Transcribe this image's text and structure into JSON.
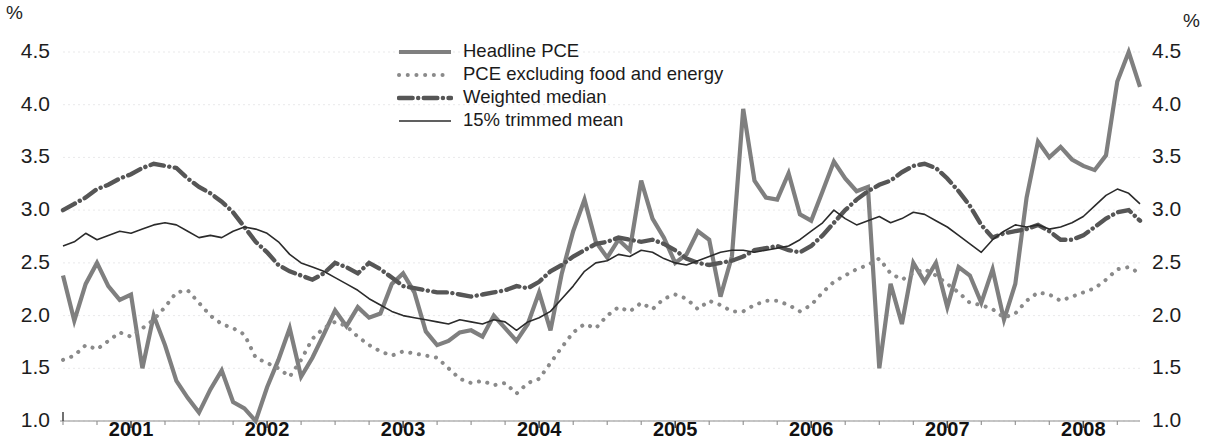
{
  "axis": {
    "unit_left": "%",
    "unit_right": "%",
    "y_ticks": [
      "1.0",
      "1.5",
      "2.0",
      "2.5",
      "3.0",
      "3.5",
      "4.0",
      "4.5"
    ],
    "x_ticks": [
      "2001",
      "2002",
      "2003",
      "2004",
      "2005",
      "2006",
      "2007",
      "2008"
    ]
  },
  "legend": {
    "items": [
      {
        "label": "Headline PCE",
        "style": "solid-thick",
        "color": "#7f7f7f"
      },
      {
        "label": "PCE excluding food and energy",
        "style": "dotted",
        "color": "#8a8a8a"
      },
      {
        "label": "Weighted median",
        "style": "dash-dot-thick",
        "color": "#565656"
      },
      {
        "label": "15% trimmed mean",
        "style": "solid-thin",
        "color": "#2b2b2b"
      }
    ]
  },
  "chart_data": {
    "type": "line",
    "title": "",
    "xlabel": "",
    "ylabel": "%",
    "ylim": [
      1.0,
      4.5
    ],
    "xlim": [
      "2000-07",
      "2008-07"
    ],
    "grid": true,
    "legend_position": "top-center",
    "x_tick_labels": [
      "2001",
      "2002",
      "2003",
      "2004",
      "2005",
      "2006",
      "2007",
      "2008"
    ],
    "y_tick_labels": [
      "1.0",
      "1.5",
      "2.0",
      "2.5",
      "3.0",
      "3.5",
      "4.0",
      "4.5"
    ],
    "x": [
      "2000-07",
      "2000-08",
      "2000-09",
      "2000-10",
      "2000-11",
      "2000-12",
      "2001-01",
      "2001-02",
      "2001-03",
      "2001-04",
      "2001-05",
      "2001-06",
      "2001-07",
      "2001-08",
      "2001-09",
      "2001-10",
      "2001-11",
      "2001-12",
      "2002-01",
      "2002-02",
      "2002-03",
      "2002-04",
      "2002-05",
      "2002-06",
      "2002-07",
      "2002-08",
      "2002-09",
      "2002-10",
      "2002-11",
      "2002-12",
      "2003-01",
      "2003-02",
      "2003-03",
      "2003-04",
      "2003-05",
      "2003-06",
      "2003-07",
      "2003-08",
      "2003-09",
      "2003-10",
      "2003-11",
      "2003-12",
      "2004-01",
      "2004-02",
      "2004-03",
      "2004-04",
      "2004-05",
      "2004-06",
      "2004-07",
      "2004-08",
      "2004-09",
      "2004-10",
      "2004-11",
      "2004-12",
      "2005-01",
      "2005-02",
      "2005-03",
      "2005-04",
      "2005-05",
      "2005-06",
      "2005-07",
      "2005-08",
      "2005-09",
      "2005-10",
      "2005-11",
      "2005-12",
      "2006-01",
      "2006-02",
      "2006-03",
      "2006-04",
      "2006-05",
      "2006-06",
      "2006-07",
      "2006-08",
      "2006-09",
      "2006-10",
      "2006-11",
      "2006-12",
      "2007-01",
      "2007-02",
      "2007-03",
      "2007-04",
      "2007-05",
      "2007-06",
      "2007-07",
      "2007-08",
      "2007-09",
      "2007-10",
      "2007-11",
      "2007-12",
      "2008-01",
      "2008-02",
      "2008-03",
      "2008-04",
      "2008-05",
      "2008-06"
    ],
    "series": [
      {
        "name": "Headline PCE",
        "style": "solid-thick",
        "color": "#7f7f7f",
        "width": 4.2,
        "values": [
          2.38,
          1.95,
          2.3,
          2.5,
          2.28,
          2.15,
          2.2,
          1.5,
          2.0,
          1.72,
          1.38,
          1.22,
          1.08,
          1.3,
          1.48,
          1.18,
          1.12,
          1.0,
          1.32,
          1.58,
          1.88,
          1.42,
          1.6,
          1.82,
          2.05,
          1.9,
          2.08,
          1.98,
          2.02,
          2.3,
          2.4,
          2.22,
          1.85,
          1.72,
          1.76,
          1.84,
          1.86,
          1.8,
          2.0,
          1.88,
          1.76,
          1.92,
          2.22,
          1.86,
          2.4,
          2.8,
          3.1,
          2.7,
          2.55,
          2.72,
          2.62,
          3.28,
          2.92,
          2.74,
          2.5,
          2.58,
          2.8,
          2.72,
          2.18,
          2.56,
          3.96,
          3.28,
          3.12,
          3.1,
          3.35,
          2.96,
          2.9,
          3.18,
          3.46,
          3.3,
          3.18,
          3.22,
          1.5,
          2.3,
          1.92,
          2.5,
          2.32,
          2.5,
          2.08,
          2.46,
          2.38,
          2.12,
          2.44,
          1.96,
          2.3,
          3.12,
          3.65,
          3.5,
          3.6,
          3.48,
          3.42,
          3.38,
          3.52,
          4.22,
          4.5,
          4.17
        ]
      },
      {
        "name": "PCE excluding food and energy",
        "style": "dotted",
        "color": "#8a8a8a",
        "width": 4.0,
        "values": [
          1.58,
          1.62,
          1.72,
          1.68,
          1.76,
          1.84,
          1.8,
          1.88,
          1.96,
          2.08,
          2.22,
          2.24,
          2.12,
          2.0,
          1.92,
          1.88,
          1.82,
          1.6,
          1.55,
          1.5,
          1.42,
          1.58,
          1.78,
          1.88,
          1.94,
          1.9,
          1.8,
          1.72,
          1.66,
          1.62,
          1.66,
          1.64,
          1.62,
          1.6,
          1.5,
          1.4,
          1.36,
          1.38,
          1.34,
          1.36,
          1.26,
          1.36,
          1.4,
          1.55,
          1.7,
          1.84,
          1.92,
          1.88,
          2.0,
          2.08,
          2.04,
          2.12,
          2.06,
          2.16,
          2.2,
          2.16,
          2.06,
          2.14,
          2.1,
          2.04,
          2.04,
          2.1,
          2.14,
          2.14,
          2.1,
          2.04,
          2.1,
          2.22,
          2.32,
          2.38,
          2.44,
          2.48,
          2.54,
          2.4,
          2.34,
          2.4,
          2.44,
          2.38,
          2.3,
          2.22,
          2.12,
          2.1,
          2.06,
          1.98,
          2.02,
          2.14,
          2.22,
          2.2,
          2.14,
          2.18,
          2.22,
          2.26,
          2.34,
          2.44,
          2.46,
          2.4
        ]
      },
      {
        "name": "Weighted median",
        "style": "dash-dot-thick",
        "color": "#565656",
        "width": 4.4,
        "values": [
          3.0,
          3.06,
          3.12,
          3.2,
          3.24,
          3.3,
          3.34,
          3.4,
          3.44,
          3.42,
          3.4,
          3.3,
          3.22,
          3.16,
          3.08,
          2.98,
          2.84,
          2.7,
          2.6,
          2.48,
          2.42,
          2.38,
          2.34,
          2.4,
          2.5,
          2.46,
          2.4,
          2.5,
          2.44,
          2.36,
          2.28,
          2.26,
          2.24,
          2.22,
          2.22,
          2.2,
          2.18,
          2.2,
          2.22,
          2.24,
          2.28,
          2.26,
          2.32,
          2.42,
          2.48,
          2.56,
          2.62,
          2.68,
          2.7,
          2.74,
          2.72,
          2.7,
          2.72,
          2.68,
          2.62,
          2.54,
          2.5,
          2.48,
          2.5,
          2.52,
          2.56,
          2.62,
          2.64,
          2.66,
          2.62,
          2.6,
          2.66,
          2.76,
          2.88,
          3.0,
          3.1,
          3.18,
          3.24,
          3.28,
          3.36,
          3.42,
          3.44,
          3.4,
          3.3,
          3.18,
          3.04,
          2.86,
          2.74,
          2.78,
          2.8,
          2.82,
          2.86,
          2.8,
          2.72,
          2.72,
          2.76,
          2.84,
          2.92,
          2.98,
          3.0,
          2.9
        ]
      },
      {
        "name": "15% trimmed mean",
        "style": "solid-thin",
        "color": "#2b2b2b",
        "width": 1.6,
        "values": [
          2.66,
          2.7,
          2.78,
          2.72,
          2.76,
          2.8,
          2.78,
          2.82,
          2.86,
          2.88,
          2.86,
          2.8,
          2.74,
          2.76,
          2.74,
          2.8,
          2.84,
          2.82,
          2.78,
          2.7,
          2.58,
          2.5,
          2.46,
          2.42,
          2.36,
          2.3,
          2.24,
          2.16,
          2.1,
          2.04,
          2.0,
          1.98,
          1.96,
          1.94,
          1.92,
          1.96,
          1.94,
          1.92,
          1.96,
          1.94,
          1.86,
          1.94,
          1.98,
          2.04,
          2.16,
          2.28,
          2.42,
          2.5,
          2.52,
          2.58,
          2.56,
          2.62,
          2.6,
          2.54,
          2.5,
          2.48,
          2.52,
          2.56,
          2.6,
          2.62,
          2.62,
          2.6,
          2.62,
          2.64,
          2.66,
          2.72,
          2.8,
          2.88,
          3.0,
          2.92,
          2.86,
          2.9,
          2.94,
          2.88,
          2.92,
          2.98,
          2.96,
          2.9,
          2.84,
          2.76,
          2.68,
          2.6,
          2.72,
          2.8,
          2.86,
          2.84,
          2.86,
          2.82,
          2.84,
          2.88,
          2.94,
          3.04,
          3.14,
          3.2,
          3.16,
          3.06
        ]
      }
    ]
  }
}
